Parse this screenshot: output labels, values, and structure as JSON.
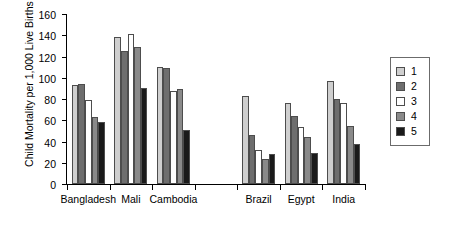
{
  "chart_data": {
    "type": "bar",
    "title": "",
    "xlabel": "",
    "ylabel": "Child Mortality per 1,000 Live Births",
    "ylim": [
      0,
      160
    ],
    "ytick_step": 20,
    "yticks": [
      0,
      20,
      40,
      60,
      80,
      100,
      120,
      140,
      160
    ],
    "grid": false,
    "legend_position": "right",
    "categories": [
      "Bangladesh",
      "Mali",
      "Cambodia",
      "",
      "Brazil",
      "Egypt",
      "India"
    ],
    "series": [
      {
        "name": "1",
        "color": "#cfcfcf",
        "values": [
          93,
          138,
          110,
          null,
          83,
          76,
          97
        ]
      },
      {
        "name": "2",
        "color": "#6e6e6e",
        "values": [
          94,
          125,
          109,
          null,
          46,
          64,
          80
        ]
      },
      {
        "name": "3",
        "color": "#ffffff",
        "values": [
          79,
          141,
          88,
          null,
          32,
          54,
          76
        ]
      },
      {
        "name": "4",
        "color": "#8a8a8a",
        "values": [
          63,
          129,
          89,
          null,
          24,
          44,
          55
        ]
      },
      {
        "name": "5",
        "color": "#1a1a1a",
        "values": [
          58,
          90,
          51,
          null,
          28,
          29,
          38
        ]
      }
    ]
  },
  "legend": {
    "items": [
      {
        "label": "1",
        "color": "#cfcfcf"
      },
      {
        "label": "2",
        "color": "#6e6e6e"
      },
      {
        "label": "3",
        "color": "#ffffff"
      },
      {
        "label": "4",
        "color": "#8a8a8a"
      },
      {
        "label": "5",
        "color": "#1a1a1a"
      }
    ]
  }
}
